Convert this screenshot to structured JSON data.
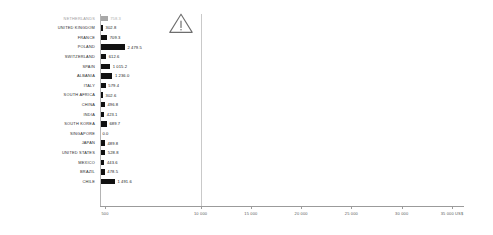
{
  "chart_data": {
    "type": "bar",
    "orientation": "horizontal",
    "title": "",
    "xlabel": "US$",
    "ylabel": "",
    "xlim": [
      0,
      35500
    ],
    "grid": true,
    "legend": false,
    "axis_unit_suffix": "US$",
    "categories": [
      "NETHERLANDS",
      "UNITED KINGDOM",
      "FRANCE",
      "POLAND",
      "SWITZERLAND",
      "SPAIN",
      "ALBANIA",
      "ITALY",
      "SOUTH AFRICA",
      "CHINA",
      "INDIA",
      "SOUTH KOREA",
      "SINGAPORE",
      "JAPAN",
      "UNITED STATES",
      "MEXICO",
      "BRAZIL",
      "CHILE"
    ],
    "values": [
      758.3,
      302.8,
      709.3,
      2479.5,
      612.6,
      1015.2,
      1236.0,
      579.4,
      302.6,
      496.8,
      423.1,
      689.7,
      0.0,
      489.8,
      528.8,
      443.6,
      478.5,
      1491.6
    ],
    "value_labels": [
      "758.3",
      "302.8",
      "709.3",
      "2 479.5",
      "612.6",
      "1 015.2",
      "1 236.0",
      "579.4",
      "302.6",
      "496.8",
      "423.1",
      "689.7",
      "0.0",
      "489.8",
      "528.8",
      "443.6",
      "478.5",
      "1 491.6"
    ],
    "highlighted_category": "NETHERLANDS",
    "xticks": [
      500,
      10000,
      15000,
      20000,
      25000,
      30000,
      35000
    ],
    "xtick_labels": [
      "500",
      "10 000",
      "15 000",
      "20 000",
      "25 000",
      "30 000",
      "35 000 US$"
    ],
    "gridline_values": [
      10000
    ],
    "colors": {
      "bar": "#111111",
      "bar_highlight": "#a8a8a8",
      "axis": "#9b9b9b",
      "grid": "#c9c9c9",
      "label": "#2b2b2b",
      "label_highlight": "#a0a0a0",
      "tick_label": "#5a5a5a"
    }
  },
  "annotations": {
    "warning_icon_name": "warning-triangle-icon",
    "warning_icon_label": "!"
  }
}
